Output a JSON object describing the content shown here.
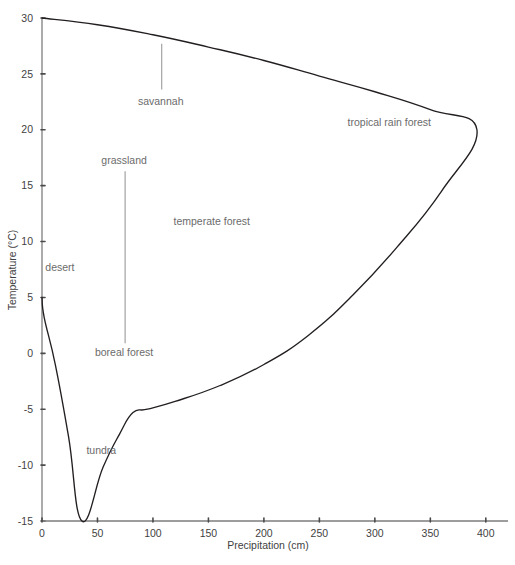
{
  "chart_data": {
    "type": "line",
    "title": "",
    "xlabel": "Precipitation  (cm)",
    "ylabel": "Temperature  (°C)",
    "xlim": [
      0,
      420
    ],
    "ylim": [
      -15,
      30
    ],
    "grid": false,
    "legend": "none",
    "xticks": [
      0,
      50,
      100,
      150,
      200,
      250,
      300,
      350,
      400
    ],
    "xtick_labels": [
      "0",
      "50",
      "100",
      "150",
      "200",
      "250",
      "300",
      "350",
      "400"
    ],
    "yticks": [
      -15,
      -10,
      -5,
      0,
      5,
      10,
      15,
      20,
      25,
      30
    ],
    "ytick_labels": [
      "-15",
      "-10",
      "-5",
      "0",
      "5",
      "10",
      "15",
      "20",
      "25",
      "30"
    ],
    "series": [
      {
        "name": "biome envelope",
        "points": [
          [
            0,
            30
          ],
          [
            50,
            29.4
          ],
          [
            100,
            28.5
          ],
          [
            150,
            27.4
          ],
          [
            200,
            26.2
          ],
          [
            250,
            24.8
          ],
          [
            300,
            23.4
          ],
          [
            350,
            21.8
          ],
          [
            392,
            20.0
          ],
          [
            360,
            14.5
          ],
          [
            320,
            9.5
          ],
          [
            280,
            5.2
          ],
          [
            240,
            1.6
          ],
          [
            200,
            -1.0
          ],
          [
            160,
            -2.9
          ],
          [
            120,
            -4.3
          ],
          [
            95,
            -5.0
          ],
          [
            82,
            -5.3
          ],
          [
            70,
            -7.2
          ],
          [
            55,
            -10.2
          ],
          [
            36,
            -15.0
          ],
          [
            24,
            -7.5
          ],
          [
            12,
            -1.0
          ],
          [
            2,
            3.2
          ],
          [
            0,
            5.0
          ]
        ]
      }
    ],
    "annotations": [
      {
        "name": "desert",
        "text": "desert",
        "x_cm": 3,
        "y_c": 7.4,
        "leader": false
      },
      {
        "name": "tundra",
        "text": "tundra",
        "x_cm": 40,
        "y_c": -9.0,
        "leader": false
      },
      {
        "name": "savannah",
        "text": "savannah",
        "x_cm": 107,
        "y_c": 22.2,
        "leader": true,
        "leader_from_c": 27.7,
        "leader_to_c": 23.6
      },
      {
        "name": "grassland",
        "text": "grassland",
        "x_cm": 74,
        "y_c": 16.9,
        "leader": true,
        "leader_from_c": 16.3,
        "leader_to_c": 0.9
      },
      {
        "name": "boreal-forest",
        "text": "boreal forest",
        "x_cm": 74,
        "y_c": -0.2,
        "leader": false
      },
      {
        "name": "temperate-forest",
        "text": "temperate forest",
        "x_cm": 153,
        "y_c": 11.5,
        "leader": false
      },
      {
        "name": "tropical-rain-forest",
        "text": "tropical rain forest",
        "x_cm": 313,
        "y_c": 20.3,
        "leader": false
      }
    ],
    "colors": {
      "curve": "#231f20",
      "axis": "#7d7d7d",
      "tick_text": "#3f3f3f",
      "annotation_text": "#6b6b6b",
      "leader_line": "#9a9a9a",
      "background": "#ffffff"
    }
  }
}
